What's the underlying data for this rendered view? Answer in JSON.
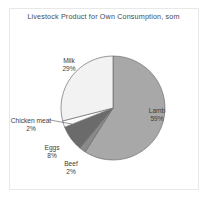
{
  "chart_data": {
    "type": "pie",
    "title": "Livestock Product for Own Consumption, som",
    "subtitle": "",
    "xlabel": "",
    "ylabel": "",
    "unit": "som",
    "grid": false,
    "legend_position": "none",
    "labels_placement": "inside-and-outside",
    "start_angle_deg": 0,
    "direction": "clockwise",
    "categories": [
      "Lamb",
      "Beef",
      "Eggs",
      "Chicken meat",
      "Milk"
    ],
    "values": [
      59,
      2,
      8,
      2,
      29
    ],
    "total": 100,
    "slices": [
      {
        "name": "Lamb",
        "label": "Lamb",
        "value": 59,
        "pct_text": "59%",
        "color": "#a8a8a8"
      },
      {
        "name": "Beef",
        "label": "Beef",
        "value": 2,
        "pct_text": "2%",
        "color": "#8a8a8a"
      },
      {
        "name": "Eggs",
        "label": "Eggs",
        "value": 8,
        "pct_text": "8%",
        "color": "#6b6b6b"
      },
      {
        "name": "Chicken meat",
        "label": "Chicken meat",
        "value": 2,
        "pct_text": "2%",
        "color": "#fbfbfb"
      },
      {
        "name": "Milk",
        "label": "Milk",
        "value": 29,
        "pct_text": "29%",
        "color": "#f2f2f2"
      }
    ]
  },
  "figure": {
    "title": "Livestock Product for Own Consumption, som",
    "frame_color": "#e8e8e8",
    "background": "#ffffff",
    "outline_color": "#6e6e6e"
  },
  "labels": {
    "milk": {
      "name": "Milk",
      "pct": "29%"
    },
    "lamb": {
      "name": "Lamb",
      "pct": "59%"
    },
    "chicken": {
      "name": "Chicken meat",
      "pct": "2%"
    },
    "eggs": {
      "name": "Eggs",
      "pct": "8%"
    },
    "beef": {
      "name": "Beef",
      "pct": "2%"
    }
  }
}
